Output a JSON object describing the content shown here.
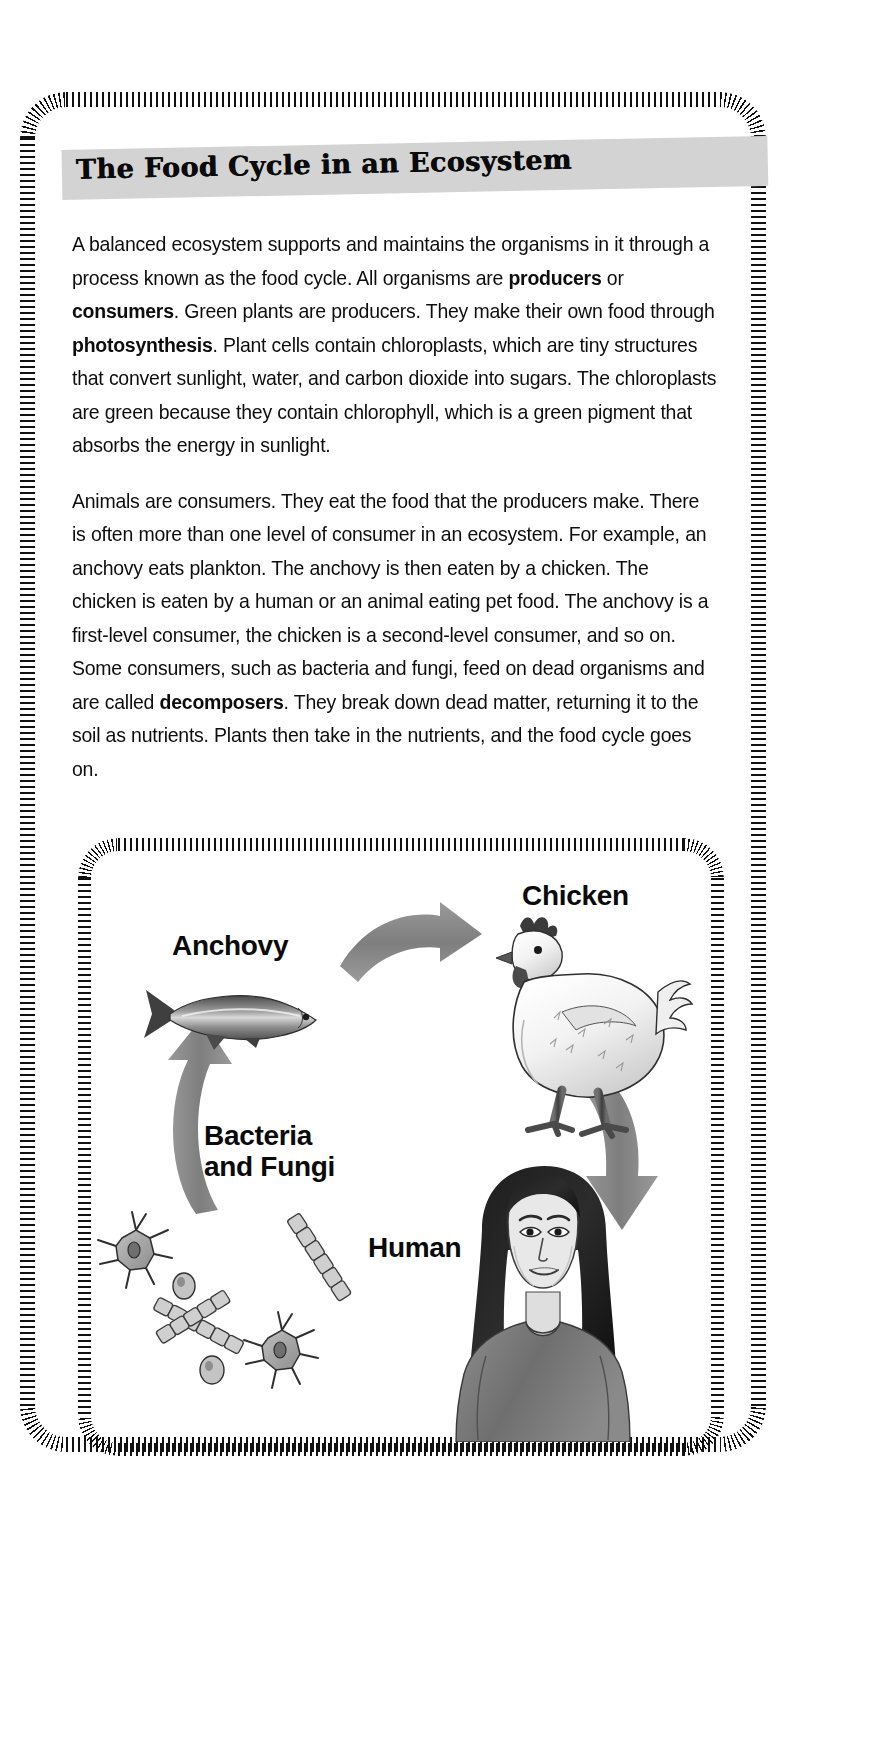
{
  "document": {
    "title": "The Food Cycle in an Ecosystem",
    "paragraphs": [
      {
        "id": "p1",
        "runs": [
          {
            "t": "A balanced ecosystem supports and maintains the organisms in it through a process known as the food cycle. All organisms are ",
            "b": false
          },
          {
            "t": "producers",
            "b": true
          },
          {
            "t": " or ",
            "b": false
          },
          {
            "t": "consumers",
            "b": true
          },
          {
            "t": ". Green plants are producers. They make their own food through ",
            "b": false
          },
          {
            "t": "photosynthesis",
            "b": true
          },
          {
            "t": ". Plant cells contain chloroplasts, which are tiny structures that convert sunlight, water, and carbon dioxide into sugars. The chloroplasts are green because they contain chlorophyll, which is a green pigment that absorbs the energy in sunlight.",
            "b": false
          }
        ]
      },
      {
        "id": "p2",
        "runs": [
          {
            "t": "Animals are consumers. They eat the food that the producers make. There is often more than one level of consumer in an ecosystem. For example, an anchovy eats plankton. The anchovy is then eaten by a chicken. The chicken is eaten by a human or an animal eating pet food. The anchovy is a first-level consumer, the chicken is a second-level consumer, and so on. Some consumers, such as bacteria and fungi, feed on dead organisms and are called ",
            "b": false
          },
          {
            "t": "decomposers",
            "b": true
          },
          {
            "t": ". They break down dead matter, returning it to the soil as nutrients. Plants then take in the nutrients, and the food cycle goes on.",
            "b": false
          }
        ]
      }
    ]
  },
  "diagram": {
    "name": "food-cycle-diagram",
    "labels": {
      "anchovy": "Anchovy",
      "chicken": "Chicken",
      "human": "Human",
      "bacteria_line1": "Bacteria",
      "bacteria_line2": "and Fungi"
    },
    "arrows": [
      {
        "name": "anchovy-to-chicken",
        "direction": "right"
      },
      {
        "name": "chicken-to-human",
        "direction": "down"
      },
      {
        "name": "bacteria-to-anchovy",
        "direction": "up"
      }
    ],
    "cycle_order": [
      "Anchovy",
      "Chicken",
      "Human",
      "Bacteria and Fungi"
    ]
  },
  "colors": {
    "title_band": "#d3d3d3",
    "ink": "#111111",
    "arrow_gray": "#8a8a8a",
    "page_background": "#ffffff"
  }
}
